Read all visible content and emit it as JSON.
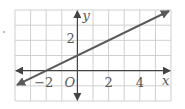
{
  "chart_data": {
    "type": "line",
    "title": "",
    "xlabel": "x",
    "ylabel": "y",
    "origin_label": "O",
    "xlim": [
      -4,
      6
    ],
    "ylim": [
      -2,
      4
    ],
    "grid": true,
    "x_tick_labels": [
      "-2",
      "2",
      "4"
    ],
    "y_tick_labels": [
      "2"
    ],
    "series": [
      {
        "name": "line",
        "equation": "y = 0.5x + 1",
        "x": [
          -4,
          6
        ],
        "y": [
          -1,
          4
        ],
        "arrows": "both"
      }
    ],
    "colors": {
      "line": "#5a5a5a",
      "grid": "#cfcfcf",
      "axis": "#444444"
    }
  },
  "labels": {
    "x_axis": "x",
    "y_axis": "y",
    "origin": "O",
    "tick_x_neg2": "−2",
    "tick_x_2": "2",
    "tick_x_4": "4",
    "tick_y_2": "2"
  }
}
